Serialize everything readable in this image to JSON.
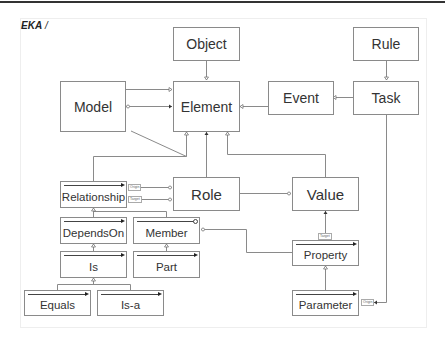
{
  "diagram": {
    "title": "EKA",
    "title_sep": " /",
    "nodes": {
      "object": "Object",
      "rule": "Rule",
      "model": "Model",
      "element": "Element",
      "event": "Event",
      "task": "Task",
      "relationship": "Relationship",
      "role": "Role",
      "value": "Value",
      "depends_on": "DependsOn",
      "member": "Member",
      "property": "Property",
      "is": "Is",
      "part": "Part",
      "equals": "Equals",
      "is_a": "Is-a",
      "parameter": "Parameter"
    },
    "edge_labels": {
      "rel_role_origin": "Origin",
      "rel_role_target": "Target",
      "property_value_target": "Target",
      "task_parameter_origin": "Origin"
    },
    "edges": [
      {
        "from": "Object",
        "to": "Element",
        "type": "generalization"
      },
      {
        "from": "Model",
        "to": "Element",
        "type": "association"
      },
      {
        "from": "Element",
        "to": "Model",
        "type": "aggregation"
      },
      {
        "from": "Event",
        "to": "Element",
        "type": "generalization"
      },
      {
        "from": "Task",
        "to": "Event",
        "type": "generalization"
      },
      {
        "from": "Rule",
        "to": "Task",
        "type": "generalization"
      },
      {
        "from": "Relationship",
        "to": "Element",
        "type": "generalization"
      },
      {
        "from": "Role",
        "to": "Element",
        "type": "association"
      },
      {
        "from": "Value",
        "to": "Element",
        "type": "generalization"
      },
      {
        "from": "Relationship",
        "to": "Role",
        "label": "Origin"
      },
      {
        "from": "Relationship",
        "to": "Role",
        "label": "Target"
      },
      {
        "from": "Role",
        "to": "Value",
        "type": "aggregation"
      },
      {
        "from": "DependsOn",
        "to": "Relationship",
        "type": "generalization"
      },
      {
        "from": "Member",
        "to": "Relationship",
        "type": "generalization"
      },
      {
        "from": "Is",
        "to": "DependsOn",
        "type": "generalization"
      },
      {
        "from": "Part",
        "to": "Member",
        "type": "generalization"
      },
      {
        "from": "Equals",
        "to": "Is",
        "type": "generalization"
      },
      {
        "from": "Is-a",
        "to": "Is",
        "type": "generalization"
      },
      {
        "from": "Property",
        "to": "Member",
        "type": "generalization"
      },
      {
        "from": "Property",
        "to": "Value",
        "label": "Target"
      },
      {
        "from": "Parameter",
        "to": "Property",
        "type": "generalization"
      },
      {
        "from": "Task",
        "to": "Parameter",
        "label": "Origin"
      }
    ]
  }
}
